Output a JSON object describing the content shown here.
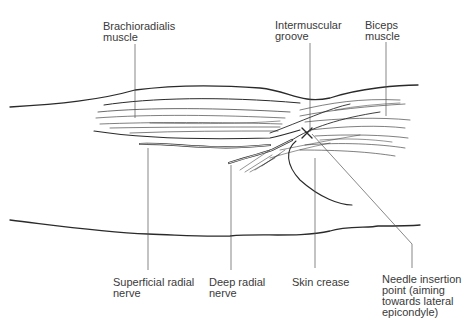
{
  "diagram": {
    "labels": {
      "brachioradialis": "Brachioradialis\nmuscle",
      "intermuscular_groove": "Intermuscular\ngroove",
      "biceps": "Biceps\nmuscle",
      "superficial_radial_nerve": "Superficial radial\nnerve",
      "deep_radial_nerve": "Deep radial\nnerve",
      "skin_crease": "Skin crease",
      "needle_insertion": "Needle insertion\npoint (aiming\ntowards lateral\nepicondyle)"
    },
    "marker": "x-mark",
    "colors": {
      "line": "#2a2a2a",
      "leader": "#555555",
      "text": "#3a3a3a"
    }
  }
}
